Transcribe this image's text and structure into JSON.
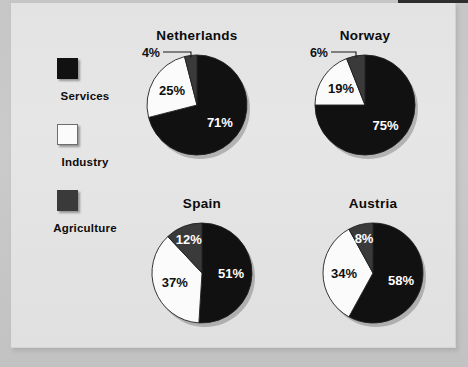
{
  "figure": {
    "background_color": "#c6c6c6",
    "panel_color": "#e4e4e4"
  },
  "legend": {
    "items": [
      {
        "label": "Services",
        "color": "#111111",
        "swatch": "black-square-swatch"
      },
      {
        "label": "Industry",
        "color": "#fbfbfb",
        "swatch": "white-square-swatch"
      },
      {
        "label": "Agriculture",
        "color": "#3a3a3a",
        "swatch": "gray-square-swatch"
      }
    ]
  },
  "chart_data": [
    {
      "type": "pie",
      "title": "Netherlands",
      "categories": [
        "Services",
        "Industry",
        "Agriculture"
      ],
      "values": [
        71,
        25,
        4
      ],
      "labels": [
        "71%",
        "25%",
        "4%"
      ],
      "colors": [
        "#111111",
        "#fbfbfb",
        "#3a3a3a"
      ],
      "label_placement": [
        "inside",
        "inside",
        "callout"
      ],
      "xlabel": "",
      "ylabel": "",
      "legend_position": "left"
    },
    {
      "type": "pie",
      "title": "Norway",
      "categories": [
        "Services",
        "Industry",
        "Agriculture"
      ],
      "values": [
        75,
        19,
        6
      ],
      "labels": [
        "75%",
        "19%",
        "6%"
      ],
      "colors": [
        "#111111",
        "#fbfbfb",
        "#3a3a3a"
      ],
      "label_placement": [
        "inside",
        "inside",
        "callout"
      ],
      "xlabel": "",
      "ylabel": "",
      "legend_position": "left"
    },
    {
      "type": "pie",
      "title": "Spain",
      "categories": [
        "Services",
        "Industry",
        "Agriculture"
      ],
      "values": [
        51,
        37,
        12
      ],
      "labels": [
        "51%",
        "37%",
        "12%"
      ],
      "colors": [
        "#111111",
        "#fbfbfb",
        "#3a3a3a"
      ],
      "label_placement": [
        "inside",
        "inside",
        "inside"
      ],
      "xlabel": "",
      "ylabel": "",
      "legend_position": "left"
    },
    {
      "type": "pie",
      "title": "Austria",
      "categories": [
        "Services",
        "Industry",
        "Agriculture"
      ],
      "values": [
        58,
        34,
        8
      ],
      "labels": [
        "58%",
        "34%",
        "8%"
      ],
      "colors": [
        "#111111",
        "#fbfbfb",
        "#3a3a3a"
      ],
      "label_placement": [
        "inside",
        "inside",
        "inside"
      ],
      "xlabel": "",
      "ylabel": "",
      "legend_position": "left"
    }
  ]
}
